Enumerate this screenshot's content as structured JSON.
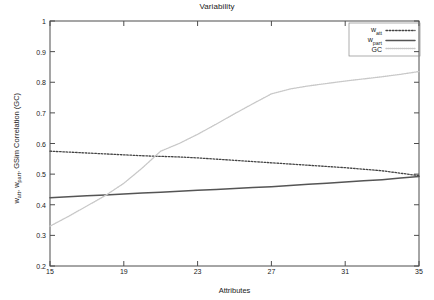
{
  "chart_data": {
    "type": "line",
    "title": "Variability",
    "xlabel": "Attributes",
    "ylabel": "w_att, w_part, GSim Correlation (GC)",
    "ylabel_parts": [
      {
        "text": "w",
        "sub": "att"
      },
      {
        "text": ", w",
        "sub": "part"
      },
      {
        "text": ", GSim Correlation (GC)",
        "sub": ""
      }
    ],
    "xlim": [
      15,
      35
    ],
    "ylim": [
      0.2,
      1
    ],
    "xticks": [
      15,
      19,
      23,
      27,
      31,
      35
    ],
    "xtick_labels": [
      "15",
      "19",
      "23",
      "27",
      "31",
      "35"
    ],
    "yticks": [
      0.2,
      0.3,
      0.4,
      0.5,
      0.6,
      0.7,
      0.8,
      0.9,
      1.0
    ],
    "ytick_labels": [
      "0.2",
      "0.3",
      "0.4",
      "0.5",
      "0.6",
      "0.7",
      "0.8",
      "0.9",
      "1"
    ],
    "grid": false,
    "legend_position": "top-right",
    "x": [
      15,
      16,
      17,
      18,
      19,
      20,
      21,
      22,
      23,
      24,
      25,
      26,
      27,
      28,
      29,
      30,
      31,
      32,
      33,
      34,
      35
    ],
    "series": [
      {
        "name": "w_att",
        "legend_label": "w",
        "legend_sub": "att",
        "style": "dotted",
        "color": "#444444",
        "values": [
          0.575,
          0.572,
          0.569,
          0.566,
          0.563,
          0.56,
          0.558,
          0.556,
          0.553,
          0.549,
          0.545,
          0.541,
          0.537,
          0.533,
          0.529,
          0.525,
          0.521,
          0.516,
          0.511,
          0.503,
          0.495
        ]
      },
      {
        "name": "w_part",
        "legend_label": "w",
        "legend_sub": "part",
        "style": "solid",
        "color": "#555555",
        "values": [
          0.423,
          0.426,
          0.429,
          0.432,
          0.435,
          0.438,
          0.441,
          0.444,
          0.447,
          0.45,
          0.453,
          0.456,
          0.459,
          0.463,
          0.467,
          0.47,
          0.474,
          0.478,
          0.482,
          0.487,
          0.492
        ]
      },
      {
        "name": "GC",
        "legend_label": "GC",
        "legend_sub": "",
        "style": "fine-dotted",
        "color": "#c8c8c8",
        "values": [
          0.33,
          0.362,
          0.396,
          0.43,
          0.47,
          0.52,
          0.575,
          0.6,
          0.63,
          0.663,
          0.697,
          0.73,
          0.762,
          0.778,
          0.788,
          0.796,
          0.804,
          0.811,
          0.818,
          0.826,
          0.835
        ]
      }
    ]
  },
  "legend": {
    "entries": [
      {
        "label": "w",
        "sub": "att"
      },
      {
        "label": "w",
        "sub": "part"
      },
      {
        "label": "GC",
        "sub": ""
      }
    ]
  }
}
